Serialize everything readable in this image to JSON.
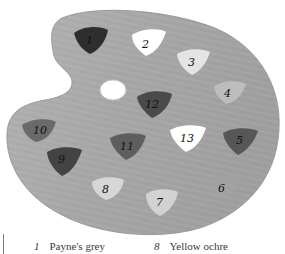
{
  "figure": {
    "colors": {
      "palette_wood": "#a9a9a9",
      "palette_edge": "#9a9a9a",
      "thumb_hole": "#ffffff",
      "background": "#ffffff"
    },
    "blobs": [
      {
        "label": "1",
        "fill": "#2e2e2e"
      },
      {
        "label": "2",
        "fill": "#ffffff"
      },
      {
        "label": "3",
        "fill": "#e4e4e4"
      },
      {
        "label": "4",
        "fill": "#bdbdbd"
      },
      {
        "label": "5",
        "fill": "#575757"
      },
      {
        "label": "6",
        "fill": "#a3a3a3"
      },
      {
        "label": "7",
        "fill": "#d2d2d2"
      },
      {
        "label": "8",
        "fill": "#d6d6d6"
      },
      {
        "label": "9",
        "fill": "#434343"
      },
      {
        "label": "10",
        "fill": "#6a6a6a"
      },
      {
        "label": "11",
        "fill": "#5e5e5e"
      },
      {
        "label": "12",
        "fill": "#4a4a4a"
      },
      {
        "label": "13",
        "fill": "#ffffff"
      }
    ]
  },
  "legend": {
    "items": [
      {
        "number": "1",
        "name": "Payne's grey"
      },
      {
        "number": "8",
        "name": "Yellow ochre"
      }
    ]
  }
}
